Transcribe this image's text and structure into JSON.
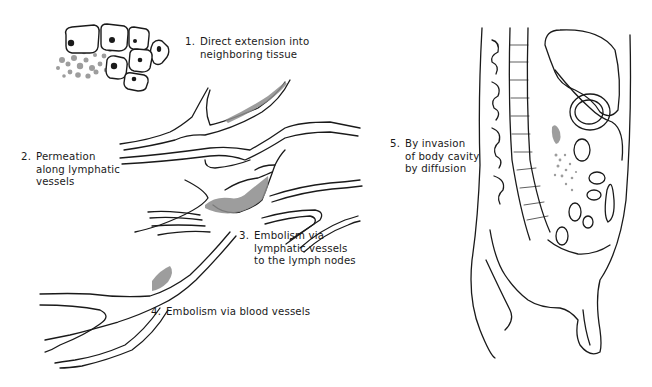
{
  "figure": {
    "labels": [
      {
        "id": "direct-extension",
        "number": "1.",
        "text": "Direct extension into\nneighboring tissue"
      },
      {
        "id": "permeation",
        "number": "2.",
        "text": "Permeation\nalong lymphatic\nvessels"
      },
      {
        "id": "lymphatic-embolism",
        "number": "3.",
        "text": "Embolism via\nlymphatic vessels\nto the lymph nodes"
      },
      {
        "id": "blood-embolism",
        "number": "4.",
        "text": "Embolism via blood vessels"
      },
      {
        "id": "body-cavity",
        "number": "5.",
        "text": "By invasion\nof body cavity\nby diffusion"
      }
    ],
    "illustrations": [
      {
        "id": "tumor-cells",
        "description": "cluster of polygonal cells with nuclei, grey tumor cells spreading left"
      },
      {
        "id": "lymphatic-network",
        "description": "branching lymphatic vessels with grey tumor mass at junction"
      },
      {
        "id": "blood-vessel",
        "description": "forked blood vessel with grey embolus"
      },
      {
        "id": "sagittal-body",
        "description": "sagittal section of torso showing spine, organs, and dotted tumor spread in cavity"
      }
    ],
    "colors": {
      "ink": "#1a1a1a",
      "tumor": "#8c8c8c",
      "background": "#ffffff"
    }
  }
}
